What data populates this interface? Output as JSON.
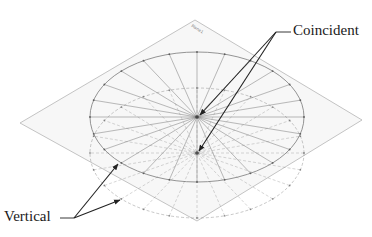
{
  "figure": {
    "plane_name": "Plane1",
    "annotations": [
      {
        "id": "coincident",
        "text": "Coincident",
        "target_count": 2
      },
      {
        "id": "vertical",
        "text": "Vertical",
        "target_count": 2
      }
    ],
    "sketches": [
      {
        "name": "upper-circle",
        "style": "solid",
        "spokes": 12
      },
      {
        "name": "lower-circle",
        "style": "dashed",
        "spokes": 12
      }
    ],
    "colors": {
      "plane_fill": "#f7f7f7",
      "plane_edge": "#b5b5b5",
      "sketch_line": "#7a7a7a",
      "arrow": "#222222",
      "text": "#1a1a1a"
    }
  },
  "labels": {
    "coincident": "Coincident",
    "vertical": "Vertical",
    "plane_tag": "Plane1"
  }
}
